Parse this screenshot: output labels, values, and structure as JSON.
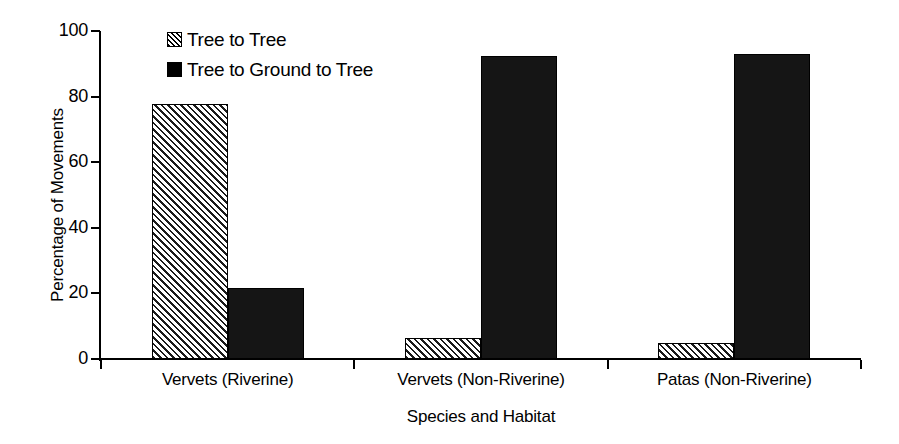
{
  "chart_data": {
    "type": "bar",
    "title": "",
    "xlabel": "Species and Habitat",
    "ylabel": "Percentage of Movements",
    "ylim": [
      0,
      100
    ],
    "yticks": [
      0,
      20,
      40,
      60,
      80,
      100
    ],
    "ytick_labels": [
      "0",
      "20",
      "40",
      "60",
      "80",
      "100"
    ],
    "grid": false,
    "legend_position": "top-left-inside",
    "categories": [
      "Vervets (Riverine)",
      "Vervets (Non-Riverine)",
      "Patas (Non-Riverine)"
    ],
    "series": [
      {
        "name": "Tree to Tree",
        "fill": "diagonal-hatch",
        "color": "#ffffff",
        "values": [
          77.7,
          6.4,
          4.9
        ]
      },
      {
        "name": "Tree to Ground to Tree",
        "fill": "solid",
        "color": "#151515",
        "values": [
          21.5,
          92.4,
          93.0
        ]
      }
    ]
  },
  "legend": {
    "items": [
      {
        "label": "Tree to Tree",
        "swatch": "hatched-square-icon"
      },
      {
        "label": "Tree to Ground to Tree",
        "swatch": "filled-square-icon"
      }
    ]
  },
  "axes": {
    "y_title": "Percentage of Movements",
    "x_title": "Species and Habitat",
    "y_ticks": [
      "100",
      "80",
      "60",
      "40",
      "20",
      "0"
    ],
    "x_categories": [
      "Vervets (Riverine)",
      "Vervets (Non-Riverine)",
      "Patas (Non-Riverine)"
    ]
  }
}
